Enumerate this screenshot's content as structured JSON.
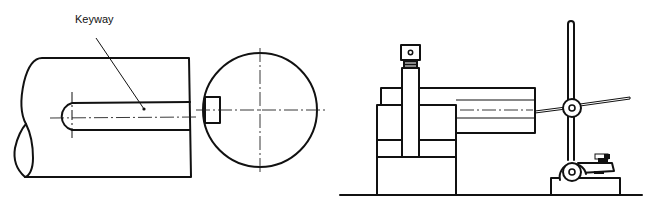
{
  "figure": {
    "left_view": {
      "title": "Shaft with keyway (side and end view)",
      "callout_label": "Keyway"
    },
    "right_view": {
      "title": "Height gauge / dial indicator stand measuring keyway on V-block"
    }
  },
  "colors": {
    "line": "#111111",
    "background": "#ffffff"
  }
}
